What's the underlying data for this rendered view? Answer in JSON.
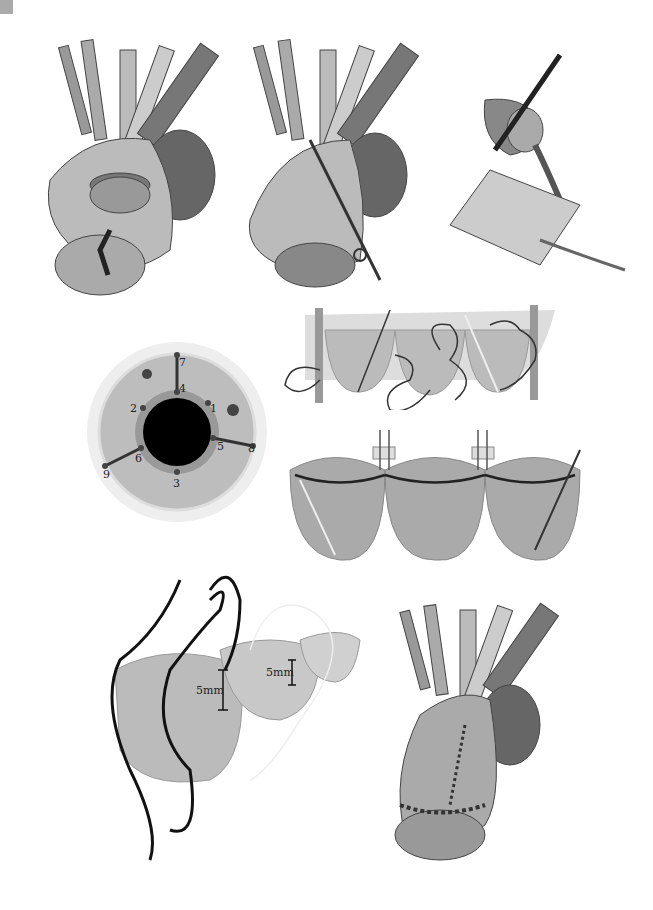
{
  "figure": {
    "panels": [
      {
        "id": "A",
        "description": "Heart with aortic root opened, valve exposed, cannula inserted"
      },
      {
        "id": "B",
        "description": "Aortic root with scissors incision"
      },
      {
        "id": "C",
        "description": "Cut tubular section clamped and rectangular graft patch cut with scissors"
      },
      {
        "id": "D",
        "description": "Top view of valve annulus with numbered suture points"
      },
      {
        "id": "E",
        "description": "Three-cusp graft strip with running sutures"
      },
      {
        "id": "F",
        "description": "Three-cusp graft sewn with commissural pledgets"
      },
      {
        "id": "G",
        "description": "Cusp suturing with 5mm measurements"
      },
      {
        "id": "H",
        "description": "Completed repair with sutured graft on aortic root"
      }
    ],
    "annulus_labels": [
      "1",
      "2",
      "3",
      "4",
      "5",
      "6",
      "7",
      "8",
      "9"
    ],
    "measurements": {
      "left": "5mm",
      "right": "5mm"
    }
  },
  "colors": {
    "dark": "#222222",
    "mid": "#888888",
    "light": "#c8c8c8",
    "pale": "#e6e6e6"
  }
}
